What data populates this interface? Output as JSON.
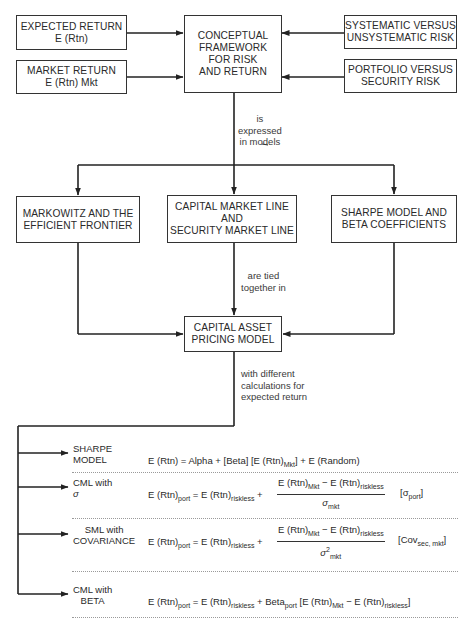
{
  "diagram": {
    "title_box": {
      "lines": [
        "CONCEPTUAL",
        "FRAMEWORK",
        "FOR RISK",
        "AND RETURN"
      ]
    },
    "inputs_left": [
      {
        "lines": [
          "EXPECTED RETURN",
          "E (Rtn)"
        ]
      },
      {
        "lines": [
          "MARKET RETURN",
          "E (Rtn) Mkt"
        ]
      }
    ],
    "inputs_right": [
      {
        "lines": [
          "SYSTEMATIC VERSUS",
          "UNSYSTEMATIC RISK"
        ]
      },
      {
        "lines": [
          "PORTFOLIO VERSUS",
          "SECURITY RISK"
        ]
      }
    ],
    "connector_1": {
      "lines": [
        "is",
        "expressed",
        "in models"
      ]
    },
    "models": [
      {
        "lines": [
          "MARKOWITZ AND THE",
          "EFFICIENT FRONTIER"
        ]
      },
      {
        "lines": [
          "CAPITAL MARKET LINE",
          "AND",
          "SECURITY MARKET LINE"
        ]
      },
      {
        "lines": [
          "SHARPE MODEL AND",
          "BETA COEFFICIENTS"
        ]
      }
    ],
    "connector_2": {
      "lines": [
        "are tied",
        "together in"
      ]
    },
    "capm_box": {
      "lines": [
        "CAPITAL ASSET",
        "PRICING MODEL"
      ]
    },
    "connector_3": {
      "lines": [
        "with different",
        "calculations for",
        "expected return"
      ]
    },
    "formulas": [
      {
        "label": [
          "SHARPE",
          "MODEL"
        ],
        "lhs": "E (Rtn) = Alpha + [Beta] [E (Rtn)",
        "lhs_sub": "Mkt",
        "rhs": "] + E (Random)"
      },
      {
        "label": [
          "CML with",
          "σ"
        ],
        "lhs": "E (Rtn)",
        "lhs_sub": "port",
        "eq": " = E (Rtn)",
        "eq_sub": "riskless",
        "plus": " +",
        "num_a": "E (Rtn)",
        "num_a_sub": "Mkt",
        "num_b": " − E (Rtn)",
        "num_b_sub": "riskless",
        "den": "σ",
        "den_sub": "mkt",
        "tail": "[σ",
        "tail_sub": "port",
        "tail_end": "]"
      },
      {
        "label": [
          "SML with",
          "COVARIANCE"
        ],
        "lhs": "E (Rtn)",
        "lhs_sub": "port",
        "eq": " = E (Rtn)",
        "eq_sub": "riskless",
        "plus": " +",
        "num_a": "E (Rtn)",
        "num_a_sub": "Mkt",
        "num_b": " − E (Rtn)",
        "num_b_sub": "riskless",
        "den": "σ",
        "den_sup": "2",
        "den_sub": "mkt",
        "tail": "[Cov",
        "tail_sub": "sec, mkt",
        "tail_end": "]"
      },
      {
        "label": [
          "CML with",
          "BETA"
        ],
        "lhs": "E (Rtn)",
        "lhs_sub": "port",
        "eq": " = E (Rtn)",
        "eq_sub": "riskless",
        "beta": " + Beta",
        "beta_sub": "port",
        "bracket": " [E (Rtn)",
        "bracket_sub": "Mkt",
        "minus": " − E (Rtn)",
        "minus_sub": "riskless",
        "end": "]"
      }
    ]
  }
}
